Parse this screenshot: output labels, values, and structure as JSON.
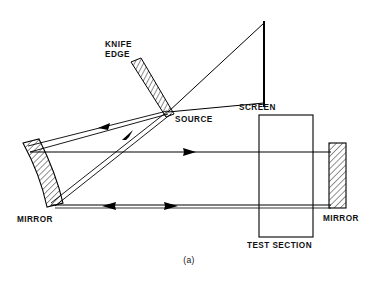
{
  "figure": {
    "caption": "(a)",
    "background_color": "#ffffff",
    "line_color": "#000000",
    "hatch_color": "#000000"
  },
  "labels": {
    "knife_edge_line1": "KNIFE",
    "knife_edge_line2": "EDGE",
    "source": "SOURCE",
    "screen": "SCREEN",
    "mirror_left": "MIRROR",
    "mirror_right": "MIRROR",
    "test_section": "TEST  SECTION"
  },
  "components": [
    {
      "id": "knife-edge",
      "name": "knife-edge",
      "shape": "hatched-parallelogram",
      "angle_deg": 62,
      "points": "131,62 141,58 174,114 166,117"
    },
    {
      "id": "mirror-left",
      "name": "mirror-left-concave",
      "shape": "hatched-tilted-curved-mirror",
      "points": "23,143 39,139 63,203 47,207"
    },
    {
      "id": "mirror-right",
      "name": "mirror-right-flat",
      "shape": "hatched-rectangle",
      "x": 329,
      "y": 143,
      "width": 17,
      "height": 65
    },
    {
      "id": "screen",
      "name": "screen",
      "shape": "vertical-line",
      "x": 264,
      "y1": 21,
      "y2": 107
    },
    {
      "id": "test-section",
      "name": "test-section",
      "shape": "open-rectangle",
      "x": 259,
      "y": 115,
      "width": 54,
      "height": 122
    }
  ],
  "rays": {
    "source_point": {
      "x": 168,
      "y": 112
    },
    "screen_top": {
      "x": 264,
      "y": 23
    },
    "screen_bottom": {
      "x": 264,
      "y": 103
    },
    "upper_beam_y": 152,
    "lower_beam_y": 207,
    "arrow_directions": {
      "upper_diagonal_to_mirror": "left",
      "source_diagonal_up": "right",
      "upper_horizontal": "right",
      "lower_horizontal_left_arrow": "left",
      "lower_horizontal_right_arrow": "right"
    }
  }
}
